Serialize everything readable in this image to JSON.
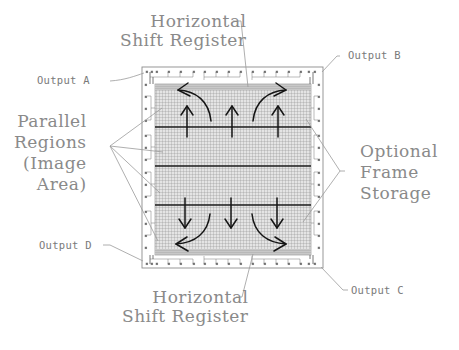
{
  "labels": {
    "top_register": {
      "line1": "Horizontal",
      "line2": "Shift Register"
    },
    "bottom_register": {
      "line1": "Horizontal",
      "line2": "Shift Register"
    },
    "parallel_regions": {
      "line1": "Parallel",
      "line2": "Regions",
      "line3": "(Image",
      "line4": "Area)"
    },
    "frame_storage": {
      "line1": "Optional",
      "line2": "Frame",
      "line3": "Storage"
    },
    "output_a": "Output A",
    "output_b": "Output B",
    "output_c": "Output C",
    "output_d": "Output D"
  },
  "chip": {
    "sections": 4,
    "top_section_flow": "up",
    "bottom_section_flow": "down",
    "arrows": {
      "up": 3,
      "down": 3,
      "curved_top": [
        "left-to-output-a",
        "right-to-output-b"
      ],
      "curved_bottom": [
        "left-to-output-d",
        "right-to-output-c"
      ]
    }
  },
  "colors": {
    "label_text": "#8a8a8a",
    "leader_line": "#9a9a9a",
    "grid_fill": "#d6d6d6",
    "grid_line": "#9c9c9c",
    "arrow": "#1a1a1a",
    "chip_border": "#8c8c8c"
  }
}
